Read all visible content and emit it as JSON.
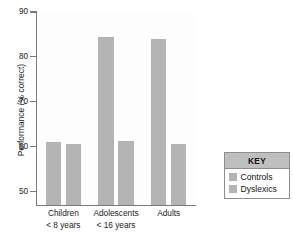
{
  "chart_data": {
    "type": "bar",
    "title": "",
    "xlabel": "",
    "ylabel": "Performance (% correct)",
    "ylim": [
      47,
      90
    ],
    "yticks": [
      50,
      60,
      70,
      80,
      90
    ],
    "ytick_labels": [
      "50",
      "60",
      "70",
      "80",
      "90"
    ],
    "grid": false,
    "categories": [
      "Children\n< 8 years",
      "Adolescents\n< 16 years",
      "Adults"
    ],
    "category_lines": [
      {
        "line1": "Children",
        "line2": "< 8 years"
      },
      {
        "line1": "Adolescents",
        "line2": "< 16 years"
      },
      {
        "line1": "Adults",
        "line2": ""
      }
    ],
    "series": [
      {
        "name": "Controls",
        "values": [
          61.0,
          84.5,
          84.0
        ],
        "color": "#b4b4b4"
      },
      {
        "name": "Dyslexics",
        "values": [
          60.7,
          61.3,
          60.7
        ],
        "color": "#b4b4b4"
      }
    ],
    "legend": {
      "position": "right",
      "title": "KEY",
      "entries": [
        {
          "label": "Controls",
          "color": "#b4b4b4"
        },
        {
          "label": "Dyslexics",
          "color": "#b4b4b4"
        }
      ]
    },
    "colors": {
      "bar": "#b4b4b4",
      "axis": "#7a7a7a",
      "text": "#1a1a1a",
      "legend_header": "#bfbfbf",
      "legend_border": "#8e8e8e",
      "plot_background": "#fdfdfd"
    }
  }
}
